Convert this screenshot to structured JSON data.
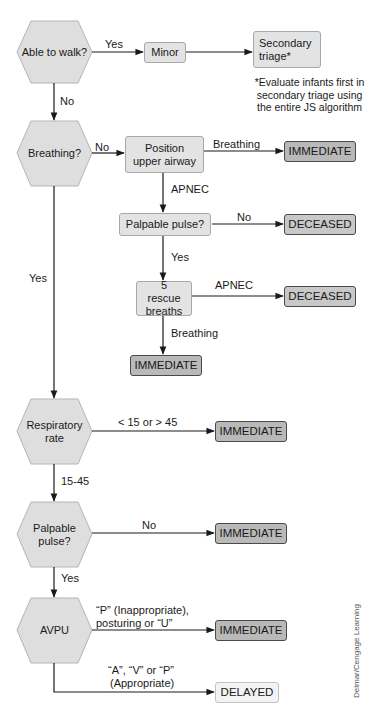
{
  "diagram": {
    "type": "flowchart",
    "decisions": [
      {
        "id": "walk",
        "label": "Able to walk?"
      },
      {
        "id": "breathing",
        "label": "Breathing?"
      },
      {
        "id": "resp_rate",
        "label": "Respiratory rate"
      },
      {
        "id": "pulse",
        "label": "Palpable pulse?"
      },
      {
        "id": "avpu",
        "label": "AVPU"
      }
    ],
    "steps": {
      "minor": "Minor",
      "secondary_triage": "Secondary triage*",
      "position_airway": "Position upper airway",
      "palpable_pulse_step": "Palpable pulse?",
      "rescue_breaths": "5 rescue breaths"
    },
    "outcomes": {
      "immediate": "IMMEDIATE",
      "deceased": "DECEASED",
      "delayed": "DELAYED"
    },
    "edge_labels": {
      "walk_yes": "Yes",
      "walk_no": "No",
      "breathing_no": "No",
      "breathing_yes": "Yes",
      "airway_breathing": "Breathing",
      "airway_apnec": "APNEC",
      "pulse_step_no": "No",
      "pulse_step_yes": "Yes",
      "rescue_apnec": "APNEC",
      "rescue_breathing": "Breathing",
      "rate_abnormal": "< 15 or > 45",
      "rate_normal": "15-45",
      "pulse_no": "No",
      "pulse_yes": "Yes",
      "avpu_inappropriate": "“P” (Inappropriate), posturing or “U”",
      "avpu_inappropriate_line1": "“P” (Inappropriate),",
      "avpu_inappropriate_line2": "posturing or “U”",
      "avpu_appropriate_line1": "“A”, “V” or “P”",
      "avpu_appropriate_line2": "(Appropriate)"
    },
    "footnote": {
      "line1": "*Evaluate infants first in",
      "line2": "secondary triage using",
      "line3": "the entire JS algorithm"
    },
    "credit": "Delmar/Cengage Learning",
    "colors": {
      "hexagon_fill": "#dedede",
      "step_fill": "#e3e3e3",
      "immediate_fill": "#b9b9b9",
      "deceased_fill": "#c8c8c8",
      "delayed_fill": "#f3f3f3",
      "line": "#1a1a1a"
    }
  }
}
